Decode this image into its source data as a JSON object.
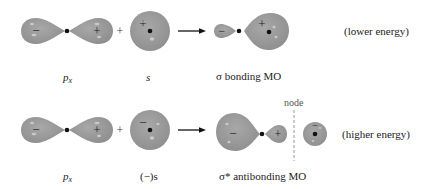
{
  "colors": {
    "orbital_fill": "#9a9a9a",
    "highlight": "#c9c9c9",
    "sign": "#222222",
    "nucleus": "#111111"
  },
  "row1": {
    "orbital1_label_base": "p",
    "orbital1_label_sub": "x",
    "orbital1_signs": [
      "−",
      "+"
    ],
    "operator": "+",
    "orbital2_label": "s",
    "orbital2_sign": "+",
    "result_label": "σ bonding MO",
    "result_signs": [
      "−",
      "+"
    ],
    "energy_note": "(lower energy)"
  },
  "row2": {
    "orbital1_label_base": "p",
    "orbital1_label_sub": "x",
    "orbital1_signs": [
      "−",
      "+"
    ],
    "operator": "+",
    "orbital2_label": "(−)s",
    "orbital2_sign": "−",
    "result_label": "σ* antibonding MO",
    "result_signs": [
      "−",
      "+",
      "−"
    ],
    "node_label": "node",
    "energy_note": "(higher energy)"
  }
}
